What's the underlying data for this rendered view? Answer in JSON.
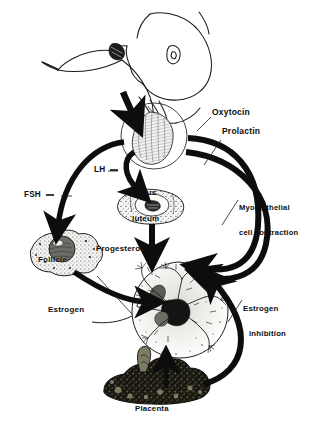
{
  "figure": {
    "background_color": "#ffffff",
    "ink_color": "#0d0d0d"
  },
  "labels": {
    "oxytocin": "Oxytocin",
    "prolactin": "Prolactin",
    "myoepithelial_line1": "Myoepithelial",
    "myoepithelial_line2": "cell contraction",
    "fsh": "FSH",
    "lh": "LH",
    "corpus_line1": "Corpus",
    "corpus_line2": "luteum",
    "progesterone": "Progesterone",
    "follicle": "Follicle",
    "estrogen": "Estrogen",
    "estrogen_inhibition_line1": "Estrogen",
    "estrogen_inhibition_line2": "inhibition",
    "placenta": "Placenta"
  },
  "structures": [
    {
      "name": "suckling-infant-and-breast",
      "label": ""
    },
    {
      "name": "pituitary-gland",
      "label": ""
    },
    {
      "name": "corpus-luteum",
      "label": "Corpus luteum"
    },
    {
      "name": "ovarian-follicle",
      "label": "Follicle"
    },
    {
      "name": "mammary-gland",
      "label": ""
    },
    {
      "name": "placenta",
      "label": "Placenta"
    }
  ],
  "arrows": [
    {
      "name": "suckling-stimulus-arrow",
      "from": "nipple",
      "to": "pituitary",
      "label": ""
    },
    {
      "name": "oxytocin-arrow",
      "from": "pituitary",
      "to": "mammary-gland",
      "label": "Oxytocin"
    },
    {
      "name": "prolactin-arrow",
      "from": "pituitary",
      "to": "mammary-gland",
      "label": "Prolactin"
    },
    {
      "name": "fsh-arrow",
      "from": "pituitary",
      "to": "ovarian-follicle",
      "label": "FSH"
    },
    {
      "name": "lh-arrow",
      "from": "pituitary",
      "to": "corpus-luteum",
      "label": "LH"
    },
    {
      "name": "progesterone-arrow",
      "from": "corpus-luteum",
      "to": "mammary-gland",
      "label": "Progesterone"
    },
    {
      "name": "estrogen-arrow",
      "from": "ovarian-follicle",
      "to": "mammary-gland",
      "label": "Estrogen"
    },
    {
      "name": "estrogen-inhibition-arrow",
      "from": "placenta",
      "to": "mammary-gland",
      "label": "Estrogen inhibition"
    },
    {
      "name": "placenta-arrow",
      "from": "placenta",
      "to": "mammary-gland",
      "label": ""
    }
  ]
}
